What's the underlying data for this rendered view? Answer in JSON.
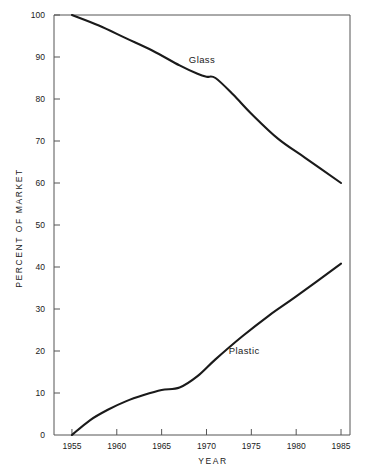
{
  "chart_data": {
    "type": "line",
    "title": "",
    "xlabel": "YEAR",
    "ylabel": "PERCENT OF MARKET",
    "xlim": [
      1953,
      1986
    ],
    "ylim": [
      0,
      100
    ],
    "xticks": [
      1955,
      1960,
      1965,
      1970,
      1975,
      1980,
      1985
    ],
    "xtick_labels": [
      "1955",
      "1960",
      "1965",
      "1970",
      "1975",
      "1980",
      "1985"
    ],
    "yticks": [
      0,
      10,
      20,
      30,
      40,
      50,
      60,
      70,
      80,
      90,
      100
    ],
    "ytick_labels": [
      "0",
      "10",
      "20",
      "30",
      "40",
      "50",
      "60",
      "70",
      "80",
      "90",
      "100"
    ],
    "grid": false,
    "legend": "inline-annotations",
    "series": [
      {
        "name": "Glass",
        "label": "Glass",
        "label_x": 1969.5,
        "label_y": 88.5,
        "x": [
          1955,
          1958,
          1961,
          1964,
          1967,
          1969,
          1970,
          1971,
          1973,
          1975,
          1978,
          1981,
          1985
        ],
        "values": [
          100,
          97.5,
          94.5,
          91.5,
          88,
          86,
          85.3,
          85,
          81,
          76.5,
          70.5,
          66,
          60
        ]
      },
      {
        "name": "Plastic",
        "label": "Plastic",
        "label_x": 1974.2,
        "label_y": 19.2,
        "x": [
          1955,
          1957,
          1959,
          1961,
          1963,
          1965,
          1967,
          1969,
          1971,
          1974,
          1977,
          1980,
          1985
        ],
        "values": [
          0,
          3.5,
          6,
          8,
          9.5,
          10.7,
          11.3,
          14,
          18,
          23.5,
          28.5,
          33,
          40.8
        ]
      }
    ]
  }
}
